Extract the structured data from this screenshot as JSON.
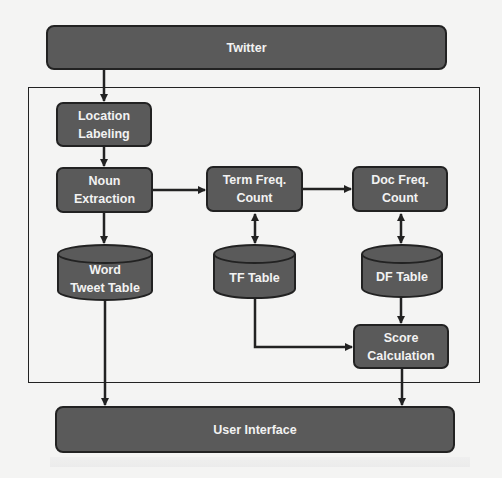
{
  "diagram": {
    "type": "flowchart",
    "nodes": {
      "twitter": {
        "label": "Twitter",
        "shape": "rounded-rect"
      },
      "location_labeling": {
        "label": "Location\nLabeling",
        "shape": "rounded-rect"
      },
      "noun_extraction": {
        "label": "Noun\nExtraction",
        "shape": "rounded-rect"
      },
      "term_freq_count": {
        "label": "Term Freq.\nCount",
        "shape": "rounded-rect"
      },
      "doc_freq_count": {
        "label": "Doc Freq.\nCount",
        "shape": "rounded-rect"
      },
      "word_tweet_table": {
        "label": "Word\nTweet Table",
        "shape": "cylinder"
      },
      "tf_table": {
        "label": "TF Table",
        "shape": "cylinder"
      },
      "df_table": {
        "label": "DF Table",
        "shape": "cylinder"
      },
      "score_calculation": {
        "label": "Score\nCalculation",
        "shape": "rounded-rect"
      },
      "user_interface": {
        "label": "User Interface",
        "shape": "rounded-rect"
      }
    },
    "edges": [
      {
        "from": "twitter",
        "to": "location_labeling",
        "direction": "forward"
      },
      {
        "from": "location_labeling",
        "to": "noun_extraction",
        "direction": "forward"
      },
      {
        "from": "noun_extraction",
        "to": "term_freq_count",
        "direction": "forward"
      },
      {
        "from": "term_freq_count",
        "to": "doc_freq_count",
        "direction": "forward"
      },
      {
        "from": "noun_extraction",
        "to": "word_tweet_table",
        "direction": "forward"
      },
      {
        "from": "term_freq_count",
        "to": "tf_table",
        "direction": "bidirectional"
      },
      {
        "from": "doc_freq_count",
        "to": "df_table",
        "direction": "bidirectional"
      },
      {
        "from": "df_table",
        "to": "score_calculation",
        "direction": "forward"
      },
      {
        "from": "tf_table",
        "to": "score_calculation",
        "direction": "forward"
      },
      {
        "from": "word_tweet_table",
        "to": "user_interface",
        "direction": "forward"
      },
      {
        "from": "score_calculation",
        "to": "user_interface",
        "direction": "forward"
      }
    ],
    "colors": {
      "node_fill": "#5a5a5a",
      "node_border": "#222222",
      "text": "#f2f2f2",
      "background": "#f4f4f3",
      "line": "#222222"
    }
  }
}
